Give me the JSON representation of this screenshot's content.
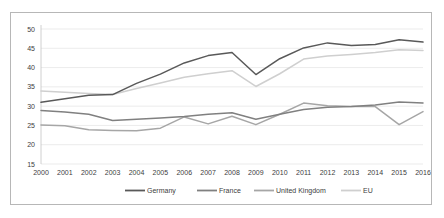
{
  "chart_data": {
    "type": "line",
    "title": "",
    "xlabel": "",
    "ylabel": "",
    "ylim": [
      15,
      50
    ],
    "yticks": [
      15,
      20,
      25,
      30,
      35,
      40,
      45,
      50
    ],
    "grid": true,
    "legend_position": "bottom",
    "categories": [
      "2000",
      "2001",
      "2002",
      "2003",
      "2004",
      "2005",
      "2006",
      "2007",
      "2008",
      "2009",
      "2010",
      "2011",
      "2012",
      "2013",
      "2014",
      "2015",
      "2016"
    ],
    "series": [
      {
        "name": "Germany",
        "color": "#595959",
        "values": [
          31.0,
          31.9,
          32.8,
          33.0,
          35.9,
          38.3,
          41.2,
          43.1,
          43.9,
          38.2,
          42.3,
          45.1,
          46.4,
          45.7,
          46.0,
          47.2,
          46.6
        ]
      },
      {
        "name": "France",
        "color": "#808080",
        "values": [
          28.9,
          28.5,
          27.9,
          26.3,
          26.6,
          26.9,
          27.3,
          27.9,
          28.3,
          26.6,
          27.9,
          29.1,
          29.7,
          29.9,
          30.3,
          31.1,
          30.8
        ]
      },
      {
        "name": "United Kingdom",
        "color": "#a6a6a6",
        "values": [
          25.1,
          24.9,
          23.9,
          23.7,
          23.6,
          24.3,
          27.2,
          25.4,
          27.4,
          25.2,
          27.9,
          30.8,
          30.1,
          29.9,
          29.9,
          25.2,
          28.6
        ]
      },
      {
        "name": "EU",
        "color": "#cfcfcf",
        "values": [
          33.9,
          33.6,
          33.3,
          33.0,
          34.6,
          36.0,
          37.5,
          38.4,
          39.2,
          35.1,
          38.4,
          42.2,
          43.0,
          43.4,
          43.9,
          44.6,
          44.4
        ]
      }
    ]
  },
  "legend": {
    "items": [
      {
        "label": "Germany"
      },
      {
        "label": "France"
      },
      {
        "label": "United Kingdom"
      },
      {
        "label": "EU"
      }
    ]
  }
}
